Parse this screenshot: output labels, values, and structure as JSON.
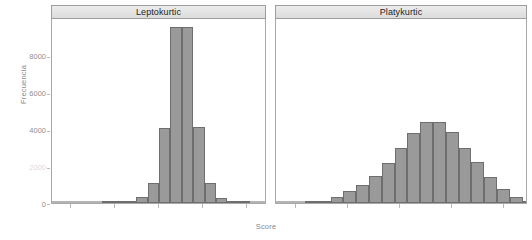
{
  "figure": {
    "xlabel": "Score",
    "ylabel": "Frecuencia"
  },
  "axes": {
    "y_ticks": [
      {
        "label": "0",
        "value": 0
      },
      {
        "label": "2000",
        "value": 2000
      },
      {
        "label": "4000",
        "value": 4000
      },
      {
        "label": "6000",
        "value": 6000
      },
      {
        "label": "8000",
        "value": 8000
      }
    ],
    "y_range": [
      0,
      9800
    ],
    "x_tick_count": 5
  },
  "panels": [
    {
      "id": "leptokurtic",
      "title": "Leptokurtic"
    },
    {
      "id": "platykurtic",
      "title": "Platykurtic"
    }
  ],
  "colors": {
    "bar_fill": "#9a9a9a",
    "bar_border": "#6e6e6e",
    "strip_fill": "#e2e2e2",
    "strip_border": "#9d9d9d",
    "panel_border": "#a9a9a9",
    "text": "#8a8a8a",
    "title_text": "#1d1d1d"
  },
  "chart_data": [
    {
      "type": "bar",
      "title": "Leptokurtic",
      "xlabel": "Score",
      "ylabel": "Frecuencia",
      "ylim": [
        0,
        9800
      ],
      "grid": false,
      "legend": "none",
      "categories": [
        "b1",
        "b2",
        "b3",
        "b4",
        "b5",
        "b6",
        "b7",
        "b8",
        "b9",
        "b10",
        "b11",
        "b12",
        "b13"
      ],
      "values": [
        30,
        40,
        60,
        300,
        1050,
        3950,
        9300,
        9300,
        4020,
        1080,
        280,
        60,
        30
      ]
    },
    {
      "type": "bar",
      "title": "Platykurtic",
      "xlabel": "Score",
      "ylabel": "Frecuencia",
      "ylim": [
        0,
        9800
      ],
      "grid": false,
      "legend": "none",
      "categories": [
        "c1",
        "c2",
        "c3",
        "c4",
        "c5",
        "c6",
        "c7",
        "c8",
        "c9",
        "c10",
        "c11",
        "c12",
        "c13",
        "c14",
        "c15",
        "c16",
        "c17",
        "c18"
      ],
      "values": [
        60,
        130,
        330,
        620,
        960,
        1450,
        2130,
        2900,
        3700,
        4280,
        4300,
        3780,
        2900,
        2150,
        1400,
        760,
        330,
        120
      ]
    }
  ]
}
